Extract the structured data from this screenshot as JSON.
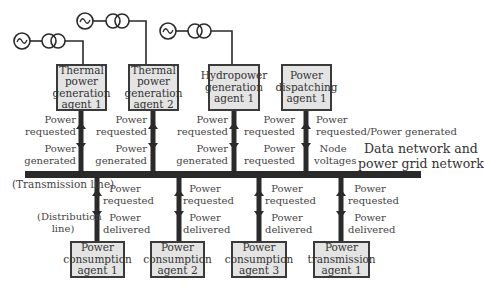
{
  "diagram": {
    "colors": {
      "line": "#2a2a2a",
      "box_fill": "#e4e4e4",
      "box_border": "#3a3a3a"
    },
    "generators": [
      {
        "id": "gen-1",
        "symbol": "ac-source-icon",
        "transformer": "transformer-icon"
      },
      {
        "id": "gen-2",
        "symbol": "ac-source-icon",
        "transformer": "transformer-icon"
      },
      {
        "id": "gen-3",
        "symbol": "ac-source-icon",
        "transformer": "transformer-icon"
      }
    ],
    "top_agents": [
      {
        "label": "Thermal power generation agent 1",
        "lines": [
          "Thermal",
          "power",
          "generation",
          "agent 1"
        ],
        "up_label": "Power requested",
        "down_label": "Power generated"
      },
      {
        "label": "Thermal power generation agent 2",
        "lines": [
          "Thermal",
          "power",
          "generation",
          "agent 2"
        ],
        "up_label": "Power requested",
        "down_label": "Power generated"
      },
      {
        "label": "Hydropower generation agent 1",
        "lines": [
          "Hydropower",
          "generation",
          "agent 1"
        ],
        "up_label": "Power requested",
        "down_label": "Power generated"
      },
      {
        "label": "Power dispatching agent 1",
        "lines": [
          "Power",
          "dispatching",
          "agent 1"
        ],
        "up_label": "Power requested",
        "down_label": "Power requested"
      }
    ],
    "dispatch_right": {
      "up_label_lines": [
        "Power",
        "requested/Power generated"
      ],
      "down_label_lines": [
        "Node",
        "voltages"
      ]
    },
    "network_label": [
      "Data network and",
      "power grid network"
    ],
    "transmission_line_label": "(Transmission line)",
    "distribution_line_label": [
      "(Distribution",
      "line)"
    ],
    "bottom_agents": [
      {
        "label": "Power consumption agent 1",
        "lines": [
          "Power",
          "consumption",
          "agent 1"
        ],
        "up_label": "Power requested",
        "down_label": "Power delivered"
      },
      {
        "label": "Power consumption agent 2",
        "lines": [
          "Power",
          "consumption",
          "agent 2"
        ],
        "up_label": "Power requested",
        "down_label": "Power delivered"
      },
      {
        "label": "Power consumption agent 3",
        "lines": [
          "Power",
          "consumption",
          "agent 3"
        ],
        "up_label": "Power requested",
        "down_label": "Power delivered"
      },
      {
        "label": "Power transmission agent 1",
        "lines": [
          "Power",
          "transmission",
          "agent 1"
        ],
        "up_label": "Power requested",
        "down_label": "Power delivered"
      }
    ]
  }
}
